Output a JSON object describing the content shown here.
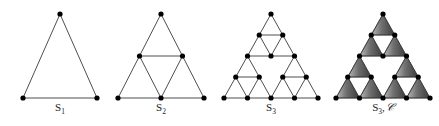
{
  "figure": {
    "background_color": "#ffffff",
    "edge_color": "#3a3a3a",
    "node_color": "#000000",
    "node_radius": 2.6,
    "edge_width": 0.9,
    "shade_light": "#b4b4b4",
    "shade_dark": "#3c3c3c",
    "hole_color": "#ffffff",
    "caption_color": "#1a1a1a"
  },
  "panels": [
    {
      "id": "panel-s1",
      "name": "sierpinski-level-1",
      "label_main": "S",
      "label_sub": "1",
      "label_extra": "",
      "label_x": 60,
      "label_y": 108,
      "apex_x": 60,
      "base_y": 98,
      "apex_y": 14,
      "half_width": 37,
      "level": 1,
      "shaded": false,
      "node_count": 3,
      "edge_count": 3
    },
    {
      "id": "panel-s2",
      "name": "sierpinski-level-2",
      "label_main": "S",
      "label_sub": "2",
      "label_extra": "",
      "label_x": 161,
      "label_y": 108,
      "apex_x": 161,
      "base_y": 98,
      "apex_y": 14,
      "half_width": 43,
      "level": 2,
      "shaded": false,
      "node_count": 6,
      "edge_count": 9
    },
    {
      "id": "panel-s3",
      "name": "sierpinski-level-3",
      "label_main": "S",
      "label_sub": "3",
      "label_extra": "",
      "label_x": 271,
      "label_y": 108,
      "apex_x": 271,
      "base_y": 98,
      "apex_y": 14,
      "half_width": 47,
      "level": 3,
      "shaded": false,
      "node_count": 15,
      "edge_count": 27
    },
    {
      "id": "panel-s3-shaded",
      "name": "sierpinski-level-3-shaded",
      "label_main": "S",
      "label_sub": "3",
      "label_extra": ", ᴶ",
      "label_x": 383,
      "label_y": 108,
      "apex_x": 383,
      "base_y": 98,
      "apex_y": 14,
      "half_width": 47,
      "level": 3,
      "shaded": true,
      "node_count": 15,
      "edge_count": 27
    }
  ],
  "captions": {
    "s1": "S₁",
    "s2": "S₂",
    "s3": "S₃",
    "s3_c": "S₃, 𝒞"
  },
  "chart_data": {
    "type": "diagram",
    "series": [
      {
        "name": "S1",
        "level": 1,
        "vertices": 3,
        "edges": 3,
        "upward_triangles": 1
      },
      {
        "name": "S2",
        "level": 2,
        "vertices": 6,
        "edges": 9,
        "upward_triangles": 3
      },
      {
        "name": "S3",
        "level": 3,
        "vertices": 15,
        "edges": 27,
        "upward_triangles": 9
      },
      {
        "name": "S3, C",
        "level": 3,
        "vertices": 15,
        "edges": 27,
        "upward_triangles": 9
      }
    ],
    "labels": [
      "S₁",
      "S₂",
      "S₃",
      "S₃, 𝒞"
    ]
  }
}
